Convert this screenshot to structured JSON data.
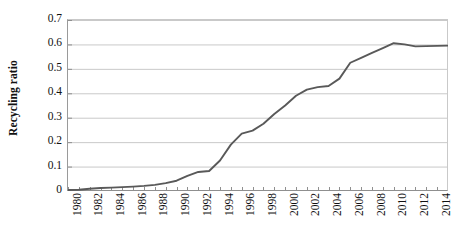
{
  "chart_data": {
    "type": "line",
    "title": "",
    "xlabel": "",
    "ylabel": "Recycling ratio",
    "xlim": [
      1980,
      2015
    ],
    "ylim": [
      0,
      0.7
    ],
    "grid": true,
    "legend": false,
    "series_color": "#595959",
    "grid_color": "#c9c9c9",
    "axis_color": "#8f8f8f",
    "ytick_labels": [
      "0.7",
      "0.6",
      "0.5",
      "0.4",
      "0.3",
      "0.2",
      "0.1",
      "0"
    ],
    "ytick_values": [
      0.7,
      0.6,
      0.5,
      0.4,
      0.3,
      0.2,
      0.1,
      0
    ],
    "xtick_labels": [
      "1980",
      "1982",
      "1984",
      "1986",
      "1988",
      "1990",
      "1992",
      "1994",
      "1996",
      "1998",
      "2000",
      "2002",
      "2004",
      "2006",
      "2008",
      "2010",
      "2012",
      "2014"
    ],
    "xtick_values": [
      1980,
      1982,
      1984,
      1986,
      1988,
      1990,
      1992,
      1994,
      1996,
      1998,
      2000,
      2002,
      2004,
      2006,
      2008,
      2010,
      2012,
      2014
    ],
    "x": [
      1980,
      1981,
      1982,
      1983,
      1984,
      1985,
      1986,
      1987,
      1988,
      1989,
      1990,
      1991,
      1992,
      1993,
      1994,
      1995,
      1996,
      1997,
      1998,
      1999,
      2000,
      2001,
      2002,
      2003,
      2004,
      2005,
      2006,
      2007,
      2008,
      2009,
      2010,
      2011,
      2012,
      2013,
      2014,
      2015
    ],
    "values": [
      0.004,
      0.005,
      0.009,
      0.012,
      0.014,
      0.016,
      0.018,
      0.021,
      0.025,
      0.032,
      0.042,
      0.062,
      0.078,
      0.082,
      0.125,
      0.19,
      0.235,
      0.247,
      0.275,
      0.315,
      0.35,
      0.39,
      0.415,
      0.425,
      0.43,
      0.46,
      0.525,
      0.545,
      0.565,
      0.585,
      0.605,
      0.6,
      0.592,
      0.593,
      0.594,
      0.595
    ],
    "y_min_data": 0.004,
    "y_max_data": 0.605,
    "peak_year": 2010,
    "peak_value": 0.605,
    "final_year": 2015,
    "final_value": 0.595
  }
}
